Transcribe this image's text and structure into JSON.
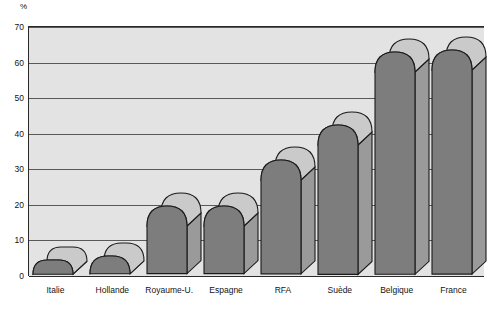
{
  "chart_data": {
    "type": "bar",
    "title": "",
    "subtitle": "",
    "xlabel": "",
    "ylabel": "%",
    "unit_label": "%",
    "categories": [
      "Italie",
      "Hollande",
      "Royaume-U.",
      "Espagne",
      "RFA",
      "Suède",
      "Belgique",
      "France"
    ],
    "values": [
      4,
      5,
      19,
      19,
      32,
      42,
      62.5,
      63
    ],
    "ylim": [
      0,
      70
    ],
    "yticks": [
      0,
      10,
      20,
      30,
      40,
      50,
      60,
      70
    ],
    "ytick_labels": [
      "0",
      "10",
      "20",
      "30",
      "40",
      "50",
      "60",
      "70"
    ],
    "grid": true,
    "grid_axis": "y",
    "legend": false,
    "legend_position": "none",
    "style": "3d-extruded-rounded-bars",
    "series": [
      {
        "name": "",
        "values": [
          4,
          5,
          19,
          19,
          32,
          42,
          62.5,
          63
        ]
      }
    ],
    "colors": {
      "bar_front": "#7d7d7d",
      "bar_top": "#cacaca",
      "bar_side": "#9a9a9a",
      "bar_outline": "#1a1a1a",
      "plot_background": "#e3e3e3",
      "gridline": "#59595c",
      "axis": "#2a2a2a",
      "page_background": "#ffffff",
      "text": "#141414"
    }
  }
}
